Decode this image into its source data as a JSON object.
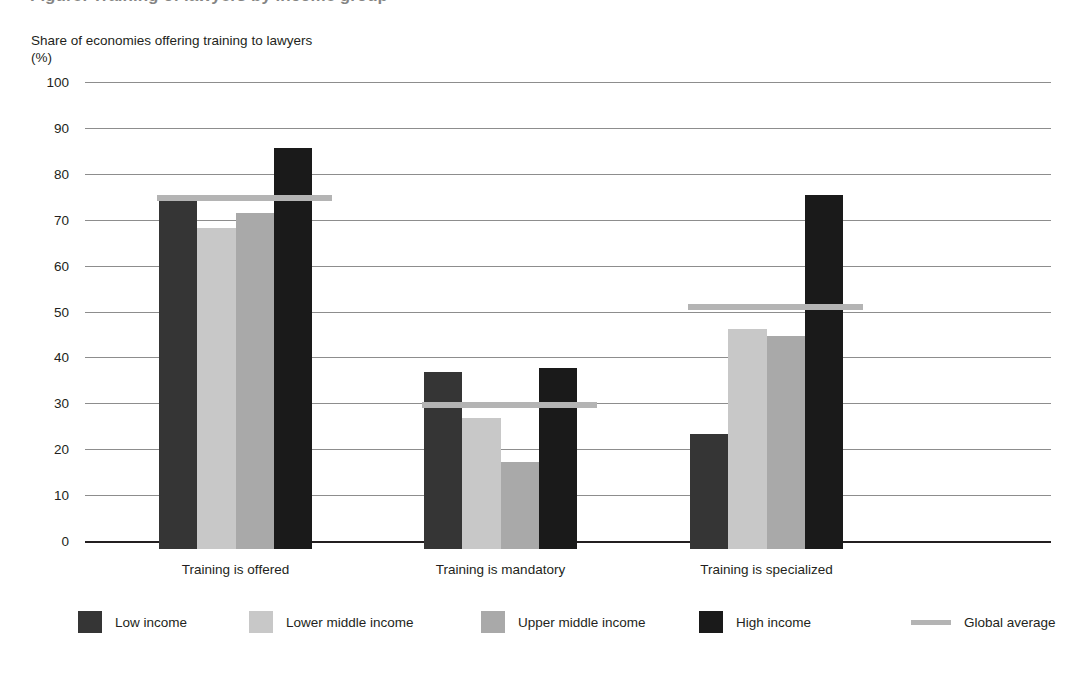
{
  "figure": {
    "cut_title": "Figure: Training of lawyers by income group",
    "axis_caption_line1": "Share of economies offering training to lawyers",
    "axis_caption_line2": "(%)"
  },
  "chart_data": {
    "type": "bar",
    "title": "Share of economies offering training to lawyers (%)",
    "xlabel": "",
    "ylabel": "Share of economies offering training to lawyers (%)",
    "ylim": [
      0,
      100
    ],
    "yticks": [
      0,
      10,
      20,
      30,
      40,
      50,
      60,
      70,
      80,
      90,
      100
    ],
    "ytick_labels": [
      "0",
      "10",
      "20",
      "30",
      "40",
      "50",
      "60",
      "70",
      "80",
      "90",
      "100"
    ],
    "grid": true,
    "legend_position": "bottom",
    "categories": [
      "Training is offered",
      "Training is mandatory",
      "Training is specialized"
    ],
    "series": [
      {
        "name": "Low income",
        "color": "#353535",
        "values": [
          76.5,
          38.5,
          25.0
        ]
      },
      {
        "name": "Lower middle income",
        "color": "#c8c8c8",
        "values": [
          70.0,
          28.5,
          48.0
        ]
      },
      {
        "name": "Upper middle income",
        "color": "#a9a9a9",
        "values": [
          73.2,
          19.0,
          46.5
        ]
      },
      {
        "name": "High income",
        "color": "#1a1a1a",
        "values": [
          87.3,
          39.5,
          77.2
        ]
      }
    ],
    "overlay": {
      "name": "Global average",
      "color": "#b4b4b4",
      "type": "line-segment",
      "values": [
        76.5,
        31.3,
        52.8
      ]
    }
  },
  "legend": {
    "items": [
      {
        "label": "Low income",
        "marker": "square",
        "color": "#353535"
      },
      {
        "label": "Lower middle income",
        "marker": "square",
        "color": "#c8c8c8"
      },
      {
        "label": "Upper middle income",
        "marker": "square",
        "color": "#a9a9a9"
      },
      {
        "label": "High income",
        "marker": "square",
        "color": "#1a1a1a"
      },
      {
        "label": "Global average",
        "marker": "line",
        "color": "#b4b4b4"
      }
    ]
  }
}
